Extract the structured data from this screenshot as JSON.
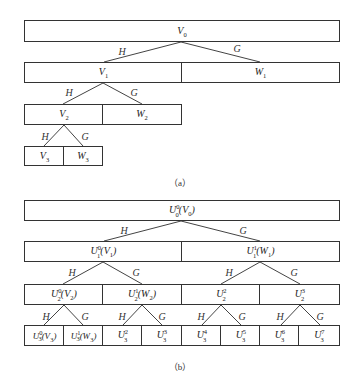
{
  "diagram_a": {
    "caption": "（a）",
    "level0": [
      {
        "label": "V",
        "sub": "0",
        "sup": ""
      }
    ],
    "level1": [
      {
        "label": "V",
        "sub": "1",
        "sup": ""
      },
      {
        "label": "W",
        "sub": "1",
        "sup": ""
      }
    ],
    "level2": [
      {
        "label": "V",
        "sub": "2",
        "sup": ""
      },
      {
        "label": "W",
        "sub": "2",
        "sup": ""
      }
    ],
    "level3": [
      {
        "label": "V",
        "sub": "3",
        "sup": ""
      },
      {
        "label": "W",
        "sub": "3",
        "sup": ""
      }
    ],
    "edge_labels": {
      "low": "H",
      "high": "G"
    }
  },
  "diagram_b": {
    "caption": "（b）",
    "level0": [
      {
        "label": "U",
        "sup": "0",
        "sub": "0",
        "arg": "(V",
        "argsub": "0",
        "close": ")"
      }
    ],
    "level1": [
      {
        "label": "U",
        "sup": "0",
        "sub": "1",
        "arg": "(V",
        "argsub": "1",
        "close": ")"
      },
      {
        "label": "U",
        "sup": "1",
        "sub": "1",
        "arg": "(W",
        "argsub": "1",
        "close": ")"
      }
    ],
    "level2": [
      {
        "label": "U",
        "sup": "0",
        "sub": "2",
        "arg": "(V",
        "argsub": "2",
        "close": ")"
      },
      {
        "label": "U",
        "sup": "1",
        "sub": "2",
        "arg": "(W",
        "argsub": "2",
        "close": ")"
      },
      {
        "label": "U",
        "sup": "2",
        "sub": "2",
        "arg": "",
        "argsub": "",
        "close": ""
      },
      {
        "label": "U",
        "sup": "3",
        "sub": "2",
        "arg": "",
        "argsub": "",
        "close": ""
      }
    ],
    "level3": [
      {
        "label": "U",
        "sup": "0",
        "sub": "3",
        "arg": "(V",
        "argsub": "3",
        "close": ")"
      },
      {
        "label": "U",
        "sup": "1",
        "sub": "3",
        "arg": "(W",
        "argsub": "3",
        "close": ")"
      },
      {
        "label": "U",
        "sup": "2",
        "sub": "3",
        "arg": "",
        "argsub": "",
        "close": ""
      },
      {
        "label": "U",
        "sup": "3",
        "sub": "3",
        "arg": "",
        "argsub": "",
        "close": ""
      },
      {
        "label": "U",
        "sup": "4",
        "sub": "3",
        "arg": "",
        "argsub": "",
        "close": ""
      },
      {
        "label": "U",
        "sup": "5",
        "sub": "3",
        "arg": "",
        "argsub": "",
        "close": ""
      },
      {
        "label": "U",
        "sup": "6",
        "sub": "3",
        "arg": "",
        "argsub": "",
        "close": ""
      },
      {
        "label": "U",
        "sup": "7",
        "sub": "3",
        "arg": "",
        "argsub": "",
        "close": ""
      }
    ],
    "edge_labels": {
      "low": "H",
      "high": "G"
    }
  }
}
